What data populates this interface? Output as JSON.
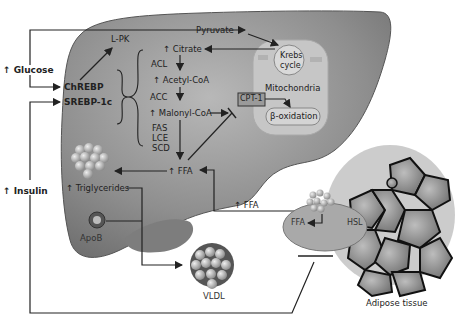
{
  "inputs": {
    "glucose": "↑ Glucose",
    "insulin": "↑ Insulin"
  },
  "transcription_factors": [
    "ChREBP",
    "SREBP-1c"
  ],
  "liver": {
    "lpk": "L-PK",
    "pyruvate": "Pyruvate",
    "citrate": "↑ Citrate",
    "acl": "ACL",
    "acetyl_coa": "↑ Acetyl-CoA",
    "acc": "ACC",
    "malonyl_coa": "↑ Malonyl-CoA",
    "fas": "FAS",
    "lce": "LCE",
    "scd": "SCD",
    "ffa": "↑ FFA",
    "triglycerides": "↑ Triglycerides",
    "apob": "ApoB",
    "vldl": "VLDL"
  },
  "mitochondria": {
    "label": "Mitochondria",
    "krebs": [
      "Krebs",
      "cycle"
    ],
    "cpt1": "CPT-1",
    "beta_oxidation": "β-oxidation"
  },
  "adipose": {
    "ffa_out": "↑ FFA",
    "ffa": "FFA",
    "hsl": "HSL",
    "label": "Adipose tissue"
  },
  "colors": {
    "liver_fill": "#8f8f8f",
    "mito_fill": "#c4c4c4",
    "cpt_fill": "#9a9a9a",
    "line": "#222222"
  }
}
